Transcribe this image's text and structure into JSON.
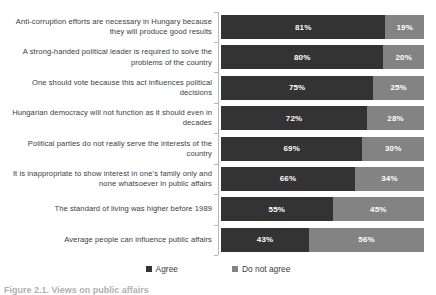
{
  "chart_data": {
    "type": "bar",
    "title": "",
    "subtitle": "",
    "xlabel": "",
    "ylabel": "",
    "orientation": "horizontal",
    "stacked": true,
    "normalized_percent": true,
    "grid": false,
    "legend_position": "bottom",
    "xlim": [
      0,
      100
    ],
    "categories": [
      "Anti-corruption efforts are necessary in Hungary because they will produce good results",
      "A strong-handed political leader is required to solve the problems of the country",
      "One should vote because this act influences political decisions",
      "Hungarian democracy will not function as it should even in decades",
      "Political parties do not really serve the interests of the country",
      "It is inappropriate to show interest in one’s family only and none whatsoever in public affairs",
      "The standard of living was higher before 1989",
      "Average people can influence public affairs"
    ],
    "series": [
      {
        "name": "Agree",
        "color": "#333333",
        "values": [
          81,
          80,
          75,
          72,
          69,
          66,
          55,
          43
        ],
        "labels": [
          "81%",
          "80%",
          "75%",
          "72%",
          "69%",
          "66%",
          "55%",
          "43%"
        ]
      },
      {
        "name": "Do not agree",
        "color": "#838383",
        "values": [
          19,
          20,
          25,
          28,
          30,
          34,
          45,
          56
        ],
        "labels": [
          "19%",
          "20%",
          "25%",
          "28%",
          "30%",
          "34%",
          "45%",
          "56%"
        ]
      }
    ]
  },
  "legend": {
    "items": [
      {
        "label": "Agree",
        "color": "#333333"
      },
      {
        "label": "Do not agree",
        "color": "#838383"
      }
    ]
  },
  "caption": {
    "text": "Figure 2.1. Views on public affairs"
  }
}
